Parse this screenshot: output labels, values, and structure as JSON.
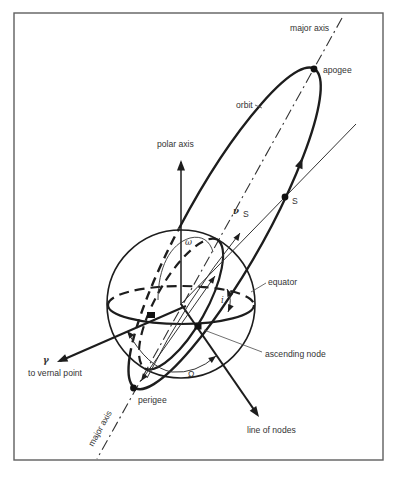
{
  "figure": {
    "labels": {
      "major_axis_top": "major axis",
      "apogee": "apogee",
      "orbit": "orbit",
      "polar_axis": "polar axis",
      "equator": "equator",
      "ascending_node": "ascending node",
      "line_of_nodes": "line of nodes",
      "to_vernal_point": "to vernal point",
      "vernal_symbol": "γ",
      "perigee": "perigee",
      "major_axis_bottom": "major axis",
      "satellite": "S",
      "argument_of_perigee": "ω",
      "raan": "Ω",
      "true_anomaly": "ν",
      "true_anomaly_sub": "S",
      "inclination": "i"
    },
    "colors": {
      "ink": "#1d1d1d",
      "text": "#333333",
      "frame": "#5f5f5f",
      "background": "#ffffff"
    }
  }
}
